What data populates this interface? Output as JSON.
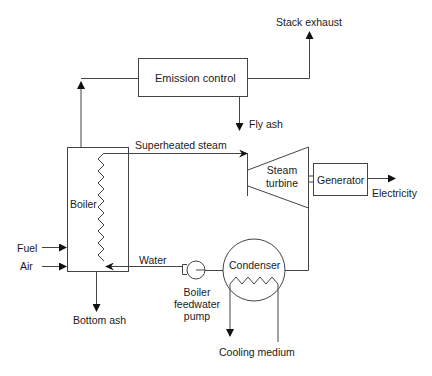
{
  "diagram": {
    "type": "power plant process flow",
    "components": {
      "emission_control": "Emission control",
      "boiler": "Boiler",
      "steam_turbine_line1": "Steam",
      "steam_turbine_line2": "turbine",
      "generator": "Generator",
      "condenser": "Condenser",
      "pump_line1": "Boiler",
      "pump_line2": "feedwater",
      "pump_line3": "pump"
    },
    "flows": {
      "stack_exhaust": "Stack exhaust",
      "fly_ash": "Fly ash",
      "superheated_steam": "Superheated steam",
      "electricity": "Electricity",
      "fuel": "Fuel",
      "air": "Air",
      "water": "Water",
      "bottom_ash": "Bottom ash",
      "cooling_medium": "Cooling medium"
    },
    "colors": {
      "line": "#333333",
      "text": "#1a1a1a",
      "background": "#ffffff"
    }
  }
}
